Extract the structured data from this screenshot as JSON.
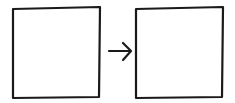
{
  "diagram": {
    "type": "flow",
    "nodes": [
      {
        "id": "box-left",
        "label": ""
      },
      {
        "id": "box-right",
        "label": ""
      }
    ],
    "edges": [
      {
        "from": "box-left",
        "to": "box-right",
        "label": "",
        "style": "arrow"
      }
    ],
    "stroke_color": "#1a1a1a",
    "background": "#ffffff"
  }
}
